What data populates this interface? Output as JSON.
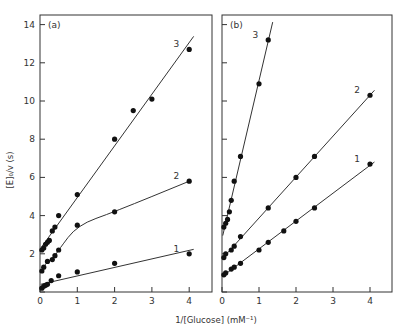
{
  "chart_data": [
    {
      "type": "line",
      "panel_label": "(a)",
      "xlabel": "1/[Glucose] (mM⁻¹)",
      "ylabel": "[E]₀/v (s)",
      "xlim": [
        0,
        4.2
      ],
      "ylim": [
        0,
        14.5
      ],
      "xticks": [
        "0",
        "1",
        "2",
        "3",
        "4"
      ],
      "yticks": [
        "0",
        "2",
        "4",
        "6",
        "8",
        "10",
        "12",
        "14"
      ],
      "grid": false,
      "series": [
        {
          "name": "1",
          "x": [
            0.05,
            0.1,
            0.15,
            0.2,
            0.3,
            0.5,
            1,
            2,
            4
          ],
          "y": [
            0.2,
            0.3,
            0.35,
            0.4,
            0.6,
            0.85,
            1.05,
            1.5,
            2.0
          ]
        },
        {
          "name": "2",
          "x": [
            0.05,
            0.1,
            0.2,
            0.33,
            0.4,
            0.5,
            1,
            2,
            4
          ],
          "y": [
            1.1,
            1.3,
            1.6,
            1.7,
            1.9,
            2.2,
            3.5,
            4.2,
            5.8
          ]
        },
        {
          "name": "3",
          "x": [
            0.05,
            0.1,
            0.15,
            0.2,
            0.25,
            0.33,
            0.4,
            0.5,
            1,
            2,
            2.5,
            3,
            4
          ],
          "y": [
            2.2,
            2.3,
            2.5,
            2.6,
            2.7,
            3.2,
            3.4,
            4.0,
            5.1,
            8.0,
            9.5,
            10.1,
            12.7
          ]
        }
      ]
    },
    {
      "type": "line",
      "panel_label": "(b)",
      "xlabel": "1/[Glucose] (mM⁻¹)",
      "ylabel": "[E]₀/v (s)",
      "xlim": [
        0,
        4.2
      ],
      "ylim": [
        0,
        14.5
      ],
      "xticks": [
        "0",
        "1",
        "2",
        "3",
        "4"
      ],
      "grid": false,
      "series": [
        {
          "name": "1",
          "x": [
            0.05,
            0.1,
            0.25,
            0.33,
            0.5,
            1,
            1.25,
            1.67,
            2,
            2.5,
            4
          ],
          "y": [
            0.9,
            1.0,
            1.2,
            1.3,
            1.5,
            2.2,
            2.6,
            3.2,
            3.7,
            4.4,
            6.7
          ]
        },
        {
          "name": "2",
          "x": [
            0.05,
            0.1,
            0.25,
            0.33,
            0.5,
            1.25,
            2,
            2.5,
            4
          ],
          "y": [
            1.8,
            2.0,
            2.2,
            2.4,
            2.9,
            4.4,
            6.0,
            7.1,
            10.3
          ]
        },
        {
          "name": "3",
          "x": [
            0.05,
            0.1,
            0.15,
            0.2,
            0.25,
            0.33,
            0.5,
            1,
            1.25
          ],
          "y": [
            3.4,
            3.6,
            3.8,
            4.2,
            4.8,
            5.8,
            7.1,
            10.9,
            13.2
          ]
        }
      ]
    }
  ],
  "labels": {
    "panel_a": "(a)",
    "panel_b": "(b)",
    "xlabel": "1/[Glucose]  (mM⁻¹)",
    "ylabel": "[E]₀/v (s)"
  }
}
